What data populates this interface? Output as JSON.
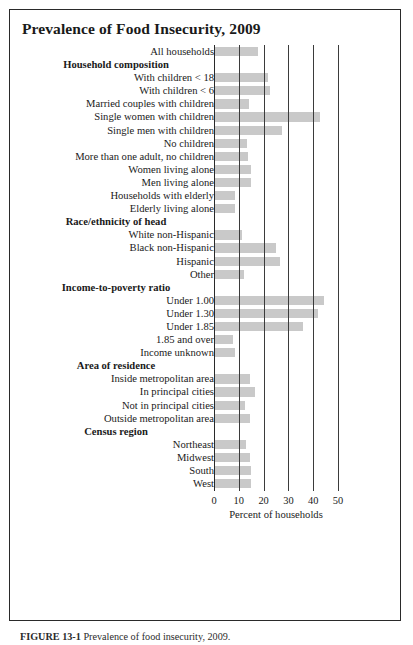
{
  "figure": {
    "title": "Prevalence of Food Insecurity, 2009",
    "caption_label": "FIGURE 13-1",
    "caption_text": "Prevalence of food insecurity, 2009."
  },
  "axis": {
    "title": "Percent of households",
    "ticks": [
      "0",
      "10",
      "20",
      "30",
      "40",
      "50"
    ]
  },
  "chart_data": {
    "type": "bar",
    "orientation": "horizontal",
    "title": "Prevalence of Food Insecurity, 2009",
    "xlabel": "Percent of households",
    "ylabel": "",
    "xlim": [
      0,
      50
    ],
    "xticks": [
      0,
      10,
      20,
      30,
      40,
      50
    ],
    "grid": true,
    "legend": "none",
    "bar_color": "#c9c9c9",
    "rows": [
      {
        "label": "All households",
        "value": 17.7,
        "section": false
      },
      {
        "label": "Household composition",
        "value": null,
        "section": true
      },
      {
        "label": "With children < 18",
        "value": 21.6,
        "section": false
      },
      {
        "label": "With children < 6",
        "value": 22.6,
        "section": false
      },
      {
        "label": "Married couples with children",
        "value": 14.1,
        "section": false
      },
      {
        "label": "Single women with children",
        "value": 42.7,
        "section": false
      },
      {
        "label": "Single men with children",
        "value": 27.6,
        "section": false
      },
      {
        "label": "No children",
        "value": 13.4,
        "section": false
      },
      {
        "label": "More than one adult, no children",
        "value": 13.6,
        "section": false
      },
      {
        "label": "Women living alone",
        "value": 15.1,
        "section": false
      },
      {
        "label": "Men living alone",
        "value": 15.1,
        "section": false
      },
      {
        "label": "Households with elderly",
        "value": 8.5,
        "section": false
      },
      {
        "label": "Elderly living alone",
        "value": 8.6,
        "section": false
      },
      {
        "label": "Race/ethnicity of head",
        "value": null,
        "section": true
      },
      {
        "label": "White non-Hispanic",
        "value": 11.2,
        "section": false
      },
      {
        "label": "Black non-Hispanic",
        "value": 25.1,
        "section": false
      },
      {
        "label": "Hispanic",
        "value": 26.6,
        "section": false
      },
      {
        "label": "Other",
        "value": 12.1,
        "section": false
      },
      {
        "label": "Income-to-poverty ratio",
        "value": null,
        "section": true
      },
      {
        "label": "Under 1.00",
        "value": 44.3,
        "section": false
      },
      {
        "label": "Under 1.30",
        "value": 42.0,
        "section": false
      },
      {
        "label": "Under 1.85",
        "value": 36.0,
        "section": false
      },
      {
        "label": "1.85 and over",
        "value": 7.6,
        "section": false
      },
      {
        "label": "Income unknown",
        "value": 8.6,
        "section": false
      },
      {
        "label": "Area of residence",
        "value": null,
        "section": true
      },
      {
        "label": "Inside metropolitan area",
        "value": 14.6,
        "section": false
      },
      {
        "label": "In principal cities",
        "value": 16.6,
        "section": false
      },
      {
        "label": "Not in principal cities",
        "value": 12.6,
        "section": false
      },
      {
        "label": "Outside metropolitan area",
        "value": 14.6,
        "section": false
      },
      {
        "label": "Census region",
        "value": null,
        "section": true
      },
      {
        "label": "Northeast",
        "value": 13.1,
        "section": false
      },
      {
        "label": "Midwest",
        "value": 14.6,
        "section": false
      },
      {
        "label": "South",
        "value": 15.1,
        "section": false
      },
      {
        "label": "West",
        "value": 15.1,
        "section": false
      }
    ]
  }
}
